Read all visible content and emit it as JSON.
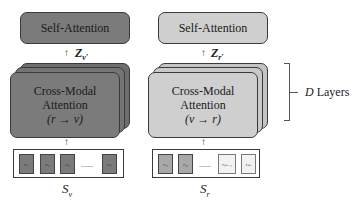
{
  "left": {
    "self_attention": "Self-Attention",
    "z_label": "Z",
    "z_sub": "v′",
    "cross_modal_line1": "Cross-Modal",
    "cross_modal_line2": "Attention",
    "cross_modal_line3": "(r → v)",
    "tokens": [
      "v_i1",
      "v_i2",
      "v_i3",
      "v_in"
    ],
    "token_display": [
      "vᵢ₁",
      "vᵢ₂",
      "vᵢ₃",
      "vᵢₙ"
    ],
    "dots": "......",
    "sequence_label": "S",
    "sequence_sub": "v",
    "color": "#7b7b7b"
  },
  "right": {
    "self_attention": "Self-Attention",
    "z_label": "Z",
    "z_sub": "r′",
    "cross_modal_line1": "Cross-Modal",
    "cross_modal_line2": "Attention",
    "cross_modal_line3": "(v → r)",
    "tokens": [
      "r_j1",
      "r_j2",
      "r_jm-1",
      "r_jm"
    ],
    "token_display": [
      "rⱼ₁",
      "rⱼ₂",
      "rⱼₘ₋₁",
      "rⱼₘ"
    ],
    "dots": "......",
    "sequence_label": "S",
    "sequence_sub": "r",
    "color": "#cfcfcf"
  },
  "layers": {
    "symbol": "D",
    "label": " Layers"
  },
  "arrow_glyph": "↑"
}
